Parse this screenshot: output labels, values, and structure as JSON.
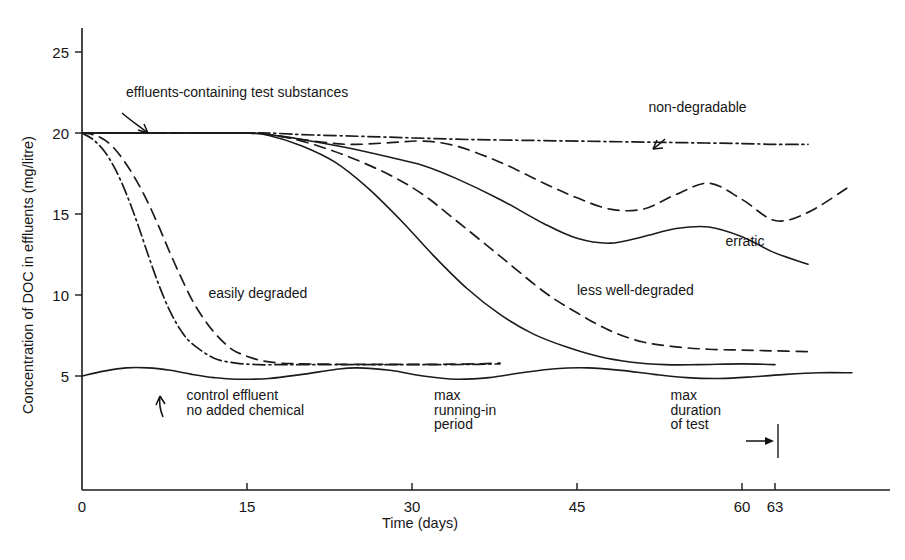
{
  "chart_data": {
    "type": "line",
    "title": "",
    "subtitle": "",
    "xlabel": "Time (days)",
    "ylabel": "Concentration of DOC in effluents (mg/litre)",
    "xlim": [
      0,
      75
    ],
    "ylim": [
      0,
      26.5
    ],
    "grid": false,
    "legend_position": "inline-annotations",
    "xticks": [
      0,
      15,
      30,
      45,
      60,
      63
    ],
    "xtick_labels": [
      "0",
      "15",
      "30",
      "45",
      "60",
      "63"
    ],
    "yticks": [
      5,
      10,
      15,
      20,
      25
    ],
    "ytick_labels": [
      "5",
      "10",
      "15",
      "20",
      "25"
    ],
    "series": [
      {
        "name": "non-degradable",
        "label": "non-degradable",
        "style": "dash-dot",
        "x": [
          0,
          5,
          10,
          15,
          17,
          20,
          25,
          30,
          35,
          40,
          45,
          50,
          55,
          60,
          63,
          66
        ],
        "y": [
          20.0,
          20.0,
          20.0,
          20.0,
          20.0,
          19.9,
          19.8,
          19.7,
          19.6,
          19.55,
          19.5,
          19.45,
          19.4,
          19.35,
          19.3,
          19.3
        ]
      },
      {
        "name": "erratic-dashed",
        "label": "erratic",
        "style": "dashed",
        "x": [
          0,
          5,
          10,
          15,
          17,
          20,
          24,
          28,
          31,
          34,
          38,
          42,
          45,
          48,
          51,
          54,
          57,
          60,
          63,
          66,
          70
        ],
        "y": [
          20.0,
          20.0,
          20.0,
          20.0,
          19.9,
          19.6,
          19.3,
          19.4,
          19.5,
          19.2,
          18.2,
          16.9,
          16.0,
          15.3,
          15.3,
          16.2,
          16.9,
          15.9,
          14.6,
          15.1,
          16.8
        ]
      },
      {
        "name": "erratic-solid",
        "label": "erratic",
        "style": "solid",
        "x": [
          0,
          5,
          10,
          15,
          17,
          20,
          24,
          28,
          31,
          34,
          38,
          42,
          45,
          48,
          51,
          54,
          57,
          60,
          63,
          66
        ],
        "y": [
          20.0,
          20.0,
          20.0,
          20.0,
          19.9,
          19.6,
          19.1,
          18.5,
          18.0,
          17.2,
          15.9,
          14.4,
          13.5,
          13.2,
          13.6,
          14.1,
          14.2,
          13.6,
          12.6,
          11.9
        ]
      },
      {
        "name": "less-well-degraded",
        "label": "less well-degraded",
        "style": "dashed",
        "x": [
          0,
          5,
          10,
          15,
          17,
          20,
          24,
          28,
          31,
          34,
          38,
          42,
          45,
          48,
          51,
          54,
          57,
          60,
          63,
          66
        ],
        "y": [
          20.0,
          20.0,
          20.0,
          20.0,
          19.9,
          19.5,
          18.6,
          17.4,
          16.2,
          14.6,
          12.4,
          10.2,
          8.9,
          7.8,
          7.1,
          6.8,
          6.65,
          6.6,
          6.55,
          6.5
        ]
      },
      {
        "name": "less-well-degraded-solid",
        "label": "",
        "style": "solid",
        "x": [
          0,
          5,
          10,
          15,
          17,
          20,
          23,
          26,
          29,
          32,
          35,
          38,
          41,
          44,
          47,
          50,
          53,
          56,
          60,
          63
        ],
        "y": [
          20.0,
          20.0,
          20.0,
          20.0,
          19.85,
          19.2,
          18.2,
          16.6,
          14.6,
          12.4,
          10.4,
          8.8,
          7.6,
          6.8,
          6.2,
          5.85,
          5.7,
          5.7,
          5.75,
          5.7
        ]
      },
      {
        "name": "easily-degraded-dash-dot",
        "label": "easily degraded",
        "style": "dash-dot",
        "x": [
          0,
          1,
          2,
          3,
          4,
          5,
          6,
          7,
          8,
          9,
          10,
          12,
          14,
          16,
          18,
          20,
          24,
          28,
          32,
          36,
          38
        ],
        "y": [
          20.0,
          19.6,
          18.9,
          17.8,
          16.3,
          14.5,
          12.5,
          10.6,
          9.0,
          7.8,
          7.0,
          6.1,
          5.8,
          5.7,
          5.7,
          5.7,
          5.7,
          5.7,
          5.7,
          5.72,
          5.75
        ]
      },
      {
        "name": "easily-degraded-dashed",
        "label": "easily degraded",
        "style": "dashed",
        "x": [
          0,
          1,
          2,
          3,
          4,
          5,
          6,
          7,
          8,
          9,
          10,
          11,
          12,
          13,
          14,
          16,
          18,
          20,
          24,
          28,
          32,
          36,
          38
        ],
        "y": [
          20.0,
          19.9,
          19.6,
          19.0,
          18.1,
          17.0,
          15.7,
          14.2,
          12.6,
          11.1,
          9.7,
          8.6,
          7.7,
          7.0,
          6.5,
          6.0,
          5.8,
          5.75,
          5.72,
          5.72,
          5.72,
          5.75,
          5.8
        ]
      },
      {
        "name": "control-effluent",
        "label": "control effluent no added chemical",
        "style": "solid",
        "x": [
          0,
          2,
          4,
          6,
          8,
          10,
          12,
          14,
          17,
          20,
          23,
          25,
          28,
          31,
          34,
          37,
          40,
          43,
          46,
          49,
          52,
          55,
          58,
          61,
          64,
          67,
          70
        ],
        "y": [
          5.0,
          5.3,
          5.5,
          5.5,
          5.35,
          5.1,
          4.9,
          4.8,
          4.85,
          5.1,
          5.4,
          5.5,
          5.35,
          5.0,
          4.8,
          4.9,
          5.2,
          5.45,
          5.5,
          5.35,
          5.1,
          4.9,
          4.85,
          4.95,
          5.1,
          5.2,
          5.2
        ]
      }
    ],
    "annotations": [
      {
        "name": "effluents-containing-test-substances",
        "text": "effluents-containing test substances",
        "x": 4,
        "y": 22.2
      },
      {
        "name": "non-degradable",
        "text": "non-degradable",
        "x": 51.5,
        "y": 21.3
      },
      {
        "name": "erratic",
        "text": "erratic",
        "x": 58.5,
        "y": 13.0
      },
      {
        "name": "less-well-degraded",
        "text": "less well-degraded",
        "x": 45,
        "y": 10.0
      },
      {
        "name": "easily-degraded",
        "text": "easily degraded",
        "x": 11.5,
        "y": 9.8
      },
      {
        "name": "control-effluent-line1",
        "text": "control effluent",
        "x": 9.5,
        "y": 3.5
      },
      {
        "name": "control-effluent-line2",
        "text": "no added chemical",
        "x": 9.5,
        "y": 2.6
      },
      {
        "name": "max-running-in-line1",
        "text": "max",
        "x": 32,
        "y": 3.5
      },
      {
        "name": "max-running-in-line2",
        "text": "running-in",
        "x": 32,
        "y": 2.6
      },
      {
        "name": "max-running-in-line3",
        "text": "period",
        "x": 32,
        "y": 1.7
      },
      {
        "name": "max-duration-line1",
        "text": "max",
        "x": 53.5,
        "y": 3.5
      },
      {
        "name": "max-duration-line2",
        "text": "duration",
        "x": 53.5,
        "y": 2.6
      },
      {
        "name": "max-duration-line3",
        "text": "of test",
        "x": 53.5,
        "y": 1.7
      }
    ],
    "markers": [
      {
        "name": "max-duration-tick",
        "x": 63,
        "description": "vertical bar with arrow pointing right at 63 days"
      }
    ],
    "colors": {
      "ink": "#1b1b1b",
      "background": "#ffffff"
    }
  }
}
